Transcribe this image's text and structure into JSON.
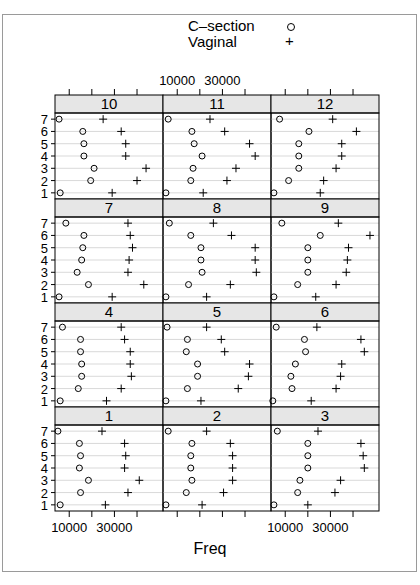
{
  "chart_data": {
    "type": "scatter",
    "subtype": "lattice dotplot",
    "title": "",
    "xlabel": "Freq",
    "ylabel": "",
    "xlim": [
      3700,
      51500
    ],
    "x_ticks": [
      10000,
      20000,
      30000,
      40000
    ],
    "x_tick_labels": [
      "10000",
      "30000"
    ],
    "y_levels": [
      "1",
      "2",
      "3",
      "4",
      "5",
      "6",
      "7"
    ],
    "grid": true,
    "legend": {
      "position": "top",
      "entries": [
        {
          "label": "C-section",
          "symbol": "o"
        },
        {
          "label": "Vaginal",
          "symbol": "+"
        }
      ]
    },
    "layout": {
      "columns": 3,
      "rows": 4
    },
    "panels": [
      {
        "label": "10",
        "row": 0,
        "col": 0,
        "series": [
          {
            "name": "C-section",
            "values": {
              "1": 6000,
              "2": 19500,
              "3": 21000,
              "4": 16500,
              "5": 16500,
              "6": 16000,
              "7": 5500
            }
          },
          {
            "name": "Vaginal",
            "values": {
              "1": 29000,
              "2": 40000,
              "3": 44000,
              "4": 35000,
              "5": 35000,
              "6": 33000,
              "7": 25000
            }
          }
        ]
      },
      {
        "label": "11",
        "row": 0,
        "col": 1,
        "series": [
          {
            "name": "C-section",
            "values": {
              "1": 5000,
              "2": 16000,
              "3": 17000,
              "4": 21000,
              "5": 17500,
              "6": 16500,
              "7": 6000
            }
          },
          {
            "name": "Vaginal",
            "values": {
              "1": 21500,
              "2": 32000,
              "3": 36000,
              "4": 44500,
              "5": 42000,
              "6": 31000,
              "7": 24500
            }
          }
        ]
      },
      {
        "label": "12",
        "row": 0,
        "col": 2,
        "series": [
          {
            "name": "C-section",
            "values": {
              "1": 5000,
              "2": 11500,
              "3": 16000,
              "4": 16000,
              "5": 16000,
              "6": 20500,
              "7": 7500
            }
          },
          {
            "name": "Vaginal",
            "values": {
              "1": 25500,
              "2": 27000,
              "3": 32500,
              "4": 35000,
              "5": 35000,
              "6": 41500,
              "7": 31000
            }
          }
        ]
      },
      {
        "label": "7",
        "row": 1,
        "col": 0,
        "series": [
          {
            "name": "C-section",
            "values": {
              "1": 5500,
              "2": 18500,
              "3": 13500,
              "4": 15500,
              "5": 16000,
              "6": 16500,
              "7": 8500
            }
          },
          {
            "name": "Vaginal",
            "values": {
              "1": 29000,
              "2": 43000,
              "3": 36000,
              "4": 36500,
              "5": 38000,
              "6": 37000,
              "7": 36000
            }
          }
        ]
      },
      {
        "label": "8",
        "row": 1,
        "col": 1,
        "series": [
          {
            "name": "C-section",
            "values": {
              "1": 5000,
              "2": 15000,
              "3": 21000,
              "4": 20500,
              "5": 20500,
              "6": 16000,
              "7": 6500
            }
          },
          {
            "name": "Vaginal",
            "values": {
              "1": 23000,
              "2": 33500,
              "3": 45000,
              "4": 44500,
              "5": 44500,
              "6": 34000,
              "7": 26000
            }
          }
        ]
      },
      {
        "label": "9",
        "row": 1,
        "col": 2,
        "series": [
          {
            "name": "C-section",
            "values": {
              "1": 5000,
              "2": 15500,
              "3": 20000,
              "4": 20000,
              "5": 20000,
              "6": 25500,
              "7": 8500
            }
          },
          {
            "name": "Vaginal",
            "values": {
              "1": 23500,
              "2": 32500,
              "3": 37000,
              "4": 37500,
              "5": 38000,
              "6": 47500,
              "7": 33500
            }
          }
        ]
      },
      {
        "label": "4",
        "row": 2,
        "col": 0,
        "series": [
          {
            "name": "C-section",
            "values": {
              "1": 6000,
              "2": 14000,
              "3": 15500,
              "4": 15500,
              "5": 15000,
              "6": 15000,
              "7": 7000
            }
          },
          {
            "name": "Vaginal",
            "values": {
              "1": 26500,
              "2": 33000,
              "3": 37500,
              "4": 37000,
              "5": 37000,
              "6": 34500,
              "7": 33000
            }
          }
        ]
      },
      {
        "label": "5",
        "row": 2,
        "col": 1,
        "series": [
          {
            "name": "C-section",
            "values": {
              "1": 5000,
              "2": 14500,
              "3": 19000,
              "4": 19000,
              "5": 14000,
              "6": 14500,
              "7": 5500
            }
          },
          {
            "name": "Vaginal",
            "values": {
              "1": 20500,
              "2": 37000,
              "3": 41500,
              "4": 42000,
              "5": 31000,
              "6": 29500,
              "7": 23000
            }
          }
        ]
      },
      {
        "label": "6",
        "row": 2,
        "col": 2,
        "series": [
          {
            "name": "C-section",
            "values": {
              "1": 4500,
              "2": 13000,
              "3": 12500,
              "4": 14500,
              "5": 19000,
              "6": 18500,
              "7": 6000
            }
          },
          {
            "name": "Vaginal",
            "values": {
              "1": 21500,
              "2": 32500,
              "3": 34500,
              "4": 35000,
              "5": 45000,
              "6": 43500,
              "7": 24000
            }
          }
        ]
      },
      {
        "label": "1",
        "row": 3,
        "col": 0,
        "series": [
          {
            "name": "C-section",
            "values": {
              "1": 6000,
              "2": 15000,
              "3": 18500,
              "4": 14500,
              "5": 15000,
              "6": 14500,
              "7": 5000
            }
          },
          {
            "name": "Vaginal",
            "values": {
              "1": 26000,
              "2": 36000,
              "3": 41000,
              "4": 34500,
              "5": 35000,
              "6": 34500,
              "7": 24500
            }
          }
        ]
      },
      {
        "label": "2",
        "row": 3,
        "col": 1,
        "series": [
          {
            "name": "C-section",
            "values": {
              "1": 5000,
              "2": 14000,
              "3": 16500,
              "4": 16000,
              "5": 16000,
              "6": 16500,
              "7": 6000
            }
          },
          {
            "name": "Vaginal",
            "values": {
              "1": 21000,
              "2": 30500,
              "3": 34500,
              "4": 34500,
              "5": 34500,
              "6": 33500,
              "7": 23000
            }
          }
        ]
      },
      {
        "label": "3",
        "row": 3,
        "col": 2,
        "series": [
          {
            "name": "C-section",
            "values": {
              "1": 5000,
              "2": 15500,
              "3": 16500,
              "4": 20000,
              "5": 20000,
              "6": 20000,
              "7": 6500
            }
          },
          {
            "name": "Vaginal",
            "values": {
              "1": 20000,
              "2": 32000,
              "3": 34500,
              "4": 45000,
              "5": 44500,
              "6": 43500,
              "7": 24500
            }
          }
        ]
      }
    ]
  },
  "legend": {
    "csection_label": "C–section",
    "csection_symbol": "o",
    "vaginal_label": "Vaginal",
    "vaginal_symbol": "+"
  },
  "axes": {
    "xlabel": "Freq",
    "top_tick_labels": [
      "10000",
      "30000"
    ],
    "bottom_tick_labels": [
      "10000",
      "30000"
    ],
    "y_tick_labels": [
      "7",
      "6",
      "5",
      "4",
      "3",
      "2",
      "1"
    ]
  },
  "colors": {
    "strip_bg": "#e6e6e6",
    "grid": "#d9d9d9",
    "panel_border": "#000000",
    "frame": "#9a9a9a",
    "symbol": "#000000"
  }
}
